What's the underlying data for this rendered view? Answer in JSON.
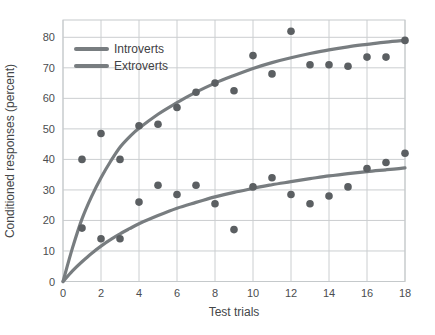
{
  "chart_data": {
    "type": "scatter",
    "title": "",
    "xlabel": "Test trials",
    "ylabel": "Conditioned responses (percent)",
    "xlim": [
      0,
      18.2
    ],
    "ylim": [
      0,
      85.5
    ],
    "xticks": [
      0,
      2,
      4,
      6,
      8,
      10,
      12,
      14,
      16,
      18
    ],
    "yticks": [
      0,
      10,
      20,
      30,
      40,
      50,
      60,
      70,
      80
    ],
    "grid": true,
    "legend_position": "top-left",
    "series": [
      {
        "name": "Introverts",
        "points": [
          [
            1,
            40
          ],
          [
            2,
            48.5
          ],
          [
            3,
            40
          ],
          [
            4,
            51
          ],
          [
            5,
            51.5
          ],
          [
            6,
            57
          ],
          [
            7,
            62
          ],
          [
            8,
            65
          ],
          [
            9,
            62.5
          ],
          [
            10,
            74
          ],
          [
            11,
            68
          ],
          [
            12,
            82
          ],
          [
            13,
            71
          ],
          [
            14,
            71
          ],
          [
            15,
            70.5
          ],
          [
            16,
            73.5
          ],
          [
            17,
            73.5
          ],
          [
            18,
            79
          ]
        ],
        "trend_curve": [
          [
            0,
            0
          ],
          [
            0.5,
            11
          ],
          [
            1,
            20.5
          ],
          [
            1.5,
            27.8
          ],
          [
            2,
            34
          ],
          [
            2.5,
            39.3
          ],
          [
            3,
            44
          ],
          [
            3.5,
            47.4
          ],
          [
            4,
            50.2
          ],
          [
            5,
            54.8
          ],
          [
            6,
            58.6
          ],
          [
            7,
            62
          ],
          [
            8,
            65
          ],
          [
            9,
            67.5
          ],
          [
            10,
            69.8
          ],
          [
            11,
            71.7
          ],
          [
            12,
            73.3
          ],
          [
            13,
            74.7
          ],
          [
            14,
            75.9
          ],
          [
            15,
            76.9
          ],
          [
            16,
            77.7
          ],
          [
            17,
            78.4
          ],
          [
            18,
            79
          ]
        ]
      },
      {
        "name": "Extroverts",
        "points": [
          [
            1,
            17.5
          ],
          [
            2,
            14
          ],
          [
            3,
            14
          ],
          [
            4,
            26
          ],
          [
            5,
            31.5
          ],
          [
            6,
            28.5
          ],
          [
            7,
            31.5
          ],
          [
            8,
            25.5
          ],
          [
            9,
            17
          ],
          [
            10,
            31
          ],
          [
            11,
            34
          ],
          [
            12,
            28.5
          ],
          [
            13,
            25.5
          ],
          [
            14,
            28
          ],
          [
            15,
            31
          ],
          [
            16,
            37
          ],
          [
            17,
            39
          ],
          [
            18,
            42
          ]
        ],
        "trend_curve": [
          [
            0,
            0
          ],
          [
            0.5,
            3.5
          ],
          [
            1,
            6.5
          ],
          [
            1.5,
            9.2
          ],
          [
            2,
            11.6
          ],
          [
            2.5,
            13.7
          ],
          [
            3,
            15.6
          ],
          [
            3.5,
            17.3
          ],
          [
            4,
            18.9
          ],
          [
            5,
            21.6
          ],
          [
            6,
            24.0
          ],
          [
            7,
            25.9
          ],
          [
            8,
            27.7
          ],
          [
            9,
            29.2
          ],
          [
            10,
            30.5
          ],
          [
            11,
            31.7
          ],
          [
            12,
            32.7
          ],
          [
            13,
            33.7
          ],
          [
            14,
            34.6
          ],
          [
            15,
            35.3
          ],
          [
            16,
            36.0
          ],
          [
            17,
            36.6
          ],
          [
            18,
            37.2
          ]
        ]
      }
    ],
    "colors": {
      "curve": "#787d80",
      "point": "#5b5f62",
      "grid": "#cbced0",
      "frame": "#c5c9cb",
      "tick_text": "#4b4d4f",
      "axis_text": "#444648",
      "background": "#ffffff"
    }
  }
}
